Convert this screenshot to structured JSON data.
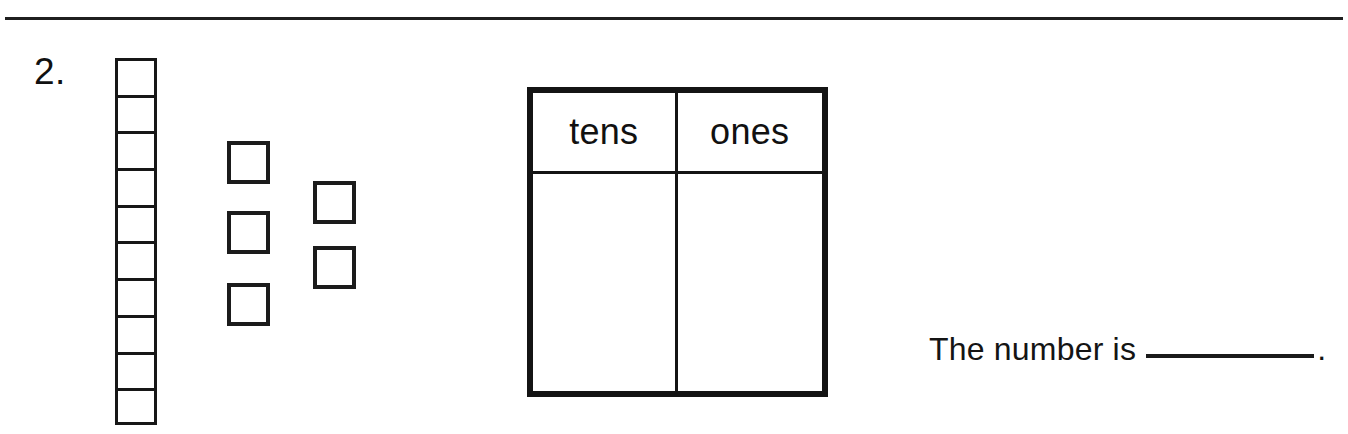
{
  "worksheet": {
    "problem_number": "2.",
    "divider": "horizontal-rule"
  },
  "base_ten_blocks": {
    "tens_rod": {
      "label": "ten-rod",
      "segment_count": 10,
      "segments": [
        "1",
        "2",
        "3",
        "4",
        "5",
        "6",
        "7",
        "8",
        "9",
        "10"
      ]
    },
    "ones_units": {
      "label": "ones-units",
      "count": 5,
      "units": [
        "1",
        "2",
        "3",
        "4",
        "5"
      ]
    }
  },
  "place_value_table": {
    "headers": [
      "tens",
      "ones"
    ],
    "values": [
      "",
      ""
    ]
  },
  "answer_prompt": {
    "text": "The number is",
    "blank": "",
    "period": "."
  }
}
